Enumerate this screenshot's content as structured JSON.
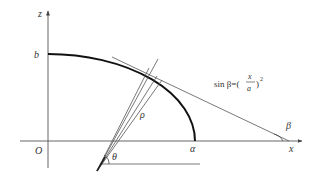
{
  "diagram": {
    "type": "geometry",
    "axes": {
      "z_label": "z",
      "x_label": "x",
      "origin_label": "O"
    },
    "points": {
      "b_label": "b",
      "a_label": "α"
    },
    "angles": {
      "theta_label": "θ",
      "beta_label": "β"
    },
    "rho_label": "ρ",
    "formula": {
      "prefix": "sin β=(",
      "numerator": "x",
      "denominator": "a",
      "suffix": ")",
      "exponent": "2"
    },
    "colors": {
      "curve": "#111111",
      "thin_lines": "#555555",
      "text": "#333333"
    }
  }
}
